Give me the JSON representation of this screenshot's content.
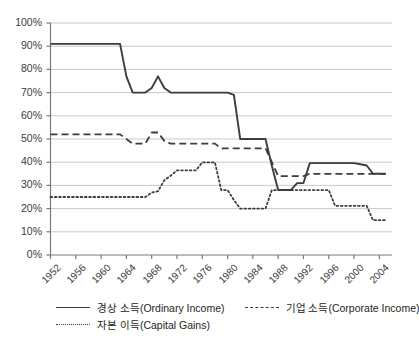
{
  "chart_data": {
    "type": "line",
    "title": "",
    "xlabel": "",
    "ylabel": "",
    "xlim": [
      1952,
      2006
    ],
    "ylim": [
      0,
      100
    ],
    "grid": true,
    "legend_position": "bottom-left",
    "y_ticks": [
      "0%",
      "10%",
      "20%",
      "30%",
      "40%",
      "50%",
      "60%",
      "70%",
      "80%",
      "90%",
      "100%"
    ],
    "y_tick_values": [
      0,
      10,
      20,
      30,
      40,
      50,
      60,
      70,
      80,
      90,
      100
    ],
    "x_ticks": [
      "1952",
      "1956",
      "1960",
      "1964",
      "1968",
      "1972",
      "1976",
      "1980",
      "1984",
      "1988",
      "1992",
      "1996",
      "2000",
      "2004"
    ],
    "x_tick_values": [
      1952,
      1956,
      1960,
      1964,
      1968,
      1972,
      1976,
      1980,
      1984,
      1988,
      1992,
      1996,
      2000,
      2004
    ],
    "series": [
      {
        "name": "경상 소득(Ordinary Income)",
        "style": "solid",
        "color": "#3d3d3d",
        "x": [
          1952,
          1963,
          1964,
          1965,
          1967,
          1968,
          1969,
          1970,
          1971,
          1980,
          1981,
          1982,
          1986,
          1987,
          1988,
          1990,
          1991,
          1992,
          1993,
          2000,
          2001,
          2002,
          2003,
          2005
        ],
        "values": [
          91,
          91,
          77,
          70,
          70,
          72,
          77,
          72,
          70,
          70,
          69,
          50,
          50,
          38.5,
          28,
          28,
          31,
          31,
          39.6,
          39.6,
          39.1,
          38.6,
          35,
          35
        ]
      },
      {
        "name": "기업 소득(Corporate Income)",
        "style": "dashed",
        "color": "#3d3d3d",
        "x": [
          1952,
          1963,
          1964,
          1965,
          1967,
          1968,
          1969,
          1970,
          1971,
          1978,
          1979,
          1986,
          1987,
          1988,
          1992,
          1993,
          2005
        ],
        "values": [
          52,
          52,
          50,
          48,
          48,
          52.8,
          52.8,
          49.2,
          48,
          48,
          46,
          46,
          40,
          34,
          34,
          35,
          35
        ]
      },
      {
        "name": "자본 이득(Capital Gains)",
        "style": "dotted",
        "color": "#3d3d3d",
        "x": [
          1952,
          1967,
          1968,
          1969,
          1970,
          1971,
          1972,
          1975,
          1976,
          1977,
          1978,
          1979,
          1980,
          1981,
          1982,
          1986,
          1987,
          1996,
          1997,
          2002,
          2003,
          2005
        ],
        "values": [
          25,
          25,
          26.9,
          27.5,
          32.2,
          34.2,
          36.5,
          36.5,
          39.9,
          39.9,
          39.9,
          28,
          28,
          23.7,
          20,
          20,
          28,
          28,
          21.2,
          21.2,
          15,
          15
        ]
      }
    ]
  },
  "legend": {
    "items": [
      {
        "label": "경상 소득(Ordinary Income)",
        "style": "solid"
      },
      {
        "label": "기업 소득(Corporate Income)",
        "style": "dashed"
      },
      {
        "label": "자본 이득(Capital Gains)",
        "style": "dotted"
      }
    ]
  },
  "colors": {
    "line": "#3d3d3d",
    "grid": "#c9c9c9",
    "axis": "#7a7a7a",
    "text": "#3b3b3b",
    "background": "#ffffff"
  }
}
